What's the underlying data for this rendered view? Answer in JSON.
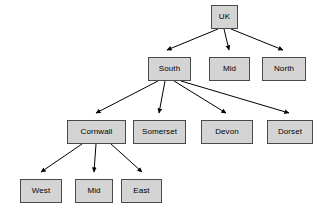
{
  "diagram": {
    "type": "tree",
    "background_color": "#ffffff",
    "node_fill_color": "#d4d4d4",
    "node_border_color": "#4a4a4a",
    "edge_color": "#000000",
    "text_color": "#000000",
    "nodes": [
      {
        "id": "uk",
        "label": "UK",
        "x": 211,
        "y": 5,
        "w": 27,
        "h": 24
      },
      {
        "id": "south",
        "label": "South",
        "x": 148,
        "y": 57,
        "w": 43,
        "h": 24
      },
      {
        "id": "mid",
        "label": "Mid",
        "x": 209,
        "y": 57,
        "w": 41,
        "h": 24
      },
      {
        "id": "north",
        "label": "North",
        "x": 262,
        "y": 57,
        "w": 44,
        "h": 24
      },
      {
        "id": "cornwall",
        "label": "Cornwall",
        "x": 67,
        "y": 120,
        "w": 59,
        "h": 24
      },
      {
        "id": "somerset",
        "label": "Somerset",
        "x": 133,
        "y": 120,
        "w": 53,
        "h": 24
      },
      {
        "id": "devon",
        "label": "Devon",
        "x": 201,
        "y": 120,
        "w": 52,
        "h": 24
      },
      {
        "id": "dorset",
        "label": "Dorset",
        "x": 267,
        "y": 120,
        "w": 46,
        "h": 24
      },
      {
        "id": "west",
        "label": "West",
        "x": 20,
        "y": 179,
        "w": 42,
        "h": 24
      },
      {
        "id": "bmid",
        "label": "Mid",
        "x": 75,
        "y": 179,
        "w": 38,
        "h": 24
      },
      {
        "id": "east",
        "label": "East",
        "x": 121,
        "y": 179,
        "w": 41,
        "h": 24
      }
    ],
    "edges": [
      {
        "from": "uk",
        "to": "south",
        "path": "M 218 29 L 167 50",
        "arrow_at": [
          167,
          55
        ]
      },
      {
        "from": "uk",
        "to": "mid",
        "path": "M 224 29 L 229 50",
        "arrow_at": [
          229,
          55
        ]
      },
      {
        "from": "uk",
        "to": "north",
        "path": "M 231 29 L 283 50",
        "arrow_at": [
          283,
          55
        ]
      },
      {
        "from": "south",
        "to": "cornwall",
        "path": "M 158 81 L 96 113",
        "arrow_at": [
          96,
          118
        ]
      },
      {
        "from": "south",
        "to": "somerset",
        "path": "M 165 81 L 159 113",
        "arrow_at": [
          159,
          118
        ]
      },
      {
        "from": "south",
        "to": "devon",
        "path": "M 174 81 L 226 113",
        "arrow_at": [
          226,
          118
        ]
      },
      {
        "from": "south",
        "to": "dorset",
        "path": "M 181 81 L 289 113",
        "arrow_at": [
          289,
          118
        ]
      },
      {
        "from": "cornwall",
        "to": "west",
        "path": "M 82 144 L 41 172",
        "arrow_at": [
          41,
          177
        ]
      },
      {
        "from": "cornwall",
        "to": "bmid",
        "path": "M 96 144 L 94 172",
        "arrow_at": [
          94,
          177
        ]
      },
      {
        "from": "cornwall",
        "to": "east",
        "path": "M 111 144 L 142 172",
        "arrow_at": [
          142,
          177
        ]
      }
    ]
  }
}
